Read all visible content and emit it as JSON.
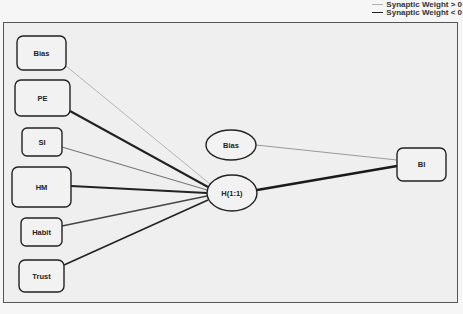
{
  "legend": {
    "positive_label": "Synaptic Weight > 0",
    "negative_label": "Synaptic Weight < 0",
    "positive_color": "#b0b0b0",
    "negative_color": "#222222"
  },
  "diagram": {
    "type": "neural-network",
    "input_layer": [
      {
        "id": "bias_in",
        "label": "Bias"
      },
      {
        "id": "pe",
        "label": "PE"
      },
      {
        "id": "si",
        "label": "SI"
      },
      {
        "id": "hm",
        "label": "HM"
      },
      {
        "id": "habit",
        "label": "Habit"
      },
      {
        "id": "trust",
        "label": "Trust"
      }
    ],
    "hidden_layer": [
      {
        "id": "bias_hidden",
        "label": "Bias"
      },
      {
        "id": "h11",
        "label": "H(1:1)"
      }
    ],
    "output_layer": [
      {
        "id": "bi",
        "label": "BI"
      }
    ],
    "connections": [
      {
        "from": "Bias",
        "to": "H(1:1)",
        "sign": "positive",
        "weight": "thin"
      },
      {
        "from": "PE",
        "to": "H(1:1)",
        "sign": "negative",
        "weight": "thick"
      },
      {
        "from": "SI",
        "to": "H(1:1)",
        "sign": "positive",
        "weight": "medium"
      },
      {
        "from": "HM",
        "to": "H(1:1)",
        "sign": "negative",
        "weight": "thick"
      },
      {
        "from": "Habit",
        "to": "H(1:1)",
        "sign": "positive",
        "weight": "medium"
      },
      {
        "from": "Trust",
        "to": "H(1:1)",
        "sign": "negative",
        "weight": "medium-thick"
      },
      {
        "from": "Bias",
        "to": "BI",
        "sign": "positive",
        "weight": "thin"
      },
      {
        "from": "H(1:1)",
        "to": "BI",
        "sign": "negative",
        "weight": "thick"
      }
    ]
  }
}
